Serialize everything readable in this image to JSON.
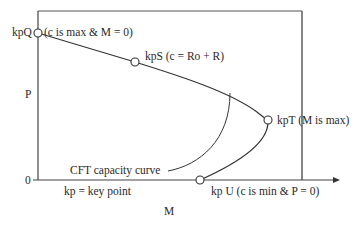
{
  "diagram": {
    "type": "P-M capacity curve with key points",
    "colors": {
      "line": "#333333",
      "frame": "#444444",
      "text": "#2a2a2a",
      "background": "#ffffff"
    },
    "axes": {
      "x_label": "M",
      "y_label": "P",
      "origin_label": "0"
    },
    "key_points": [
      {
        "id": "kpQ",
        "label": "kpQ",
        "note": "(c is max & M = 0)"
      },
      {
        "id": "kpS",
        "label": "kpS (c = Ro + R)"
      },
      {
        "id": "kpT",
        "label": "kpT (M is max)"
      },
      {
        "id": "kpU",
        "label": "kp U (c is min & P = 0)"
      }
    ],
    "annotations": {
      "curve_label": "CFT capacity curve",
      "legend": "kp = key point"
    }
  }
}
